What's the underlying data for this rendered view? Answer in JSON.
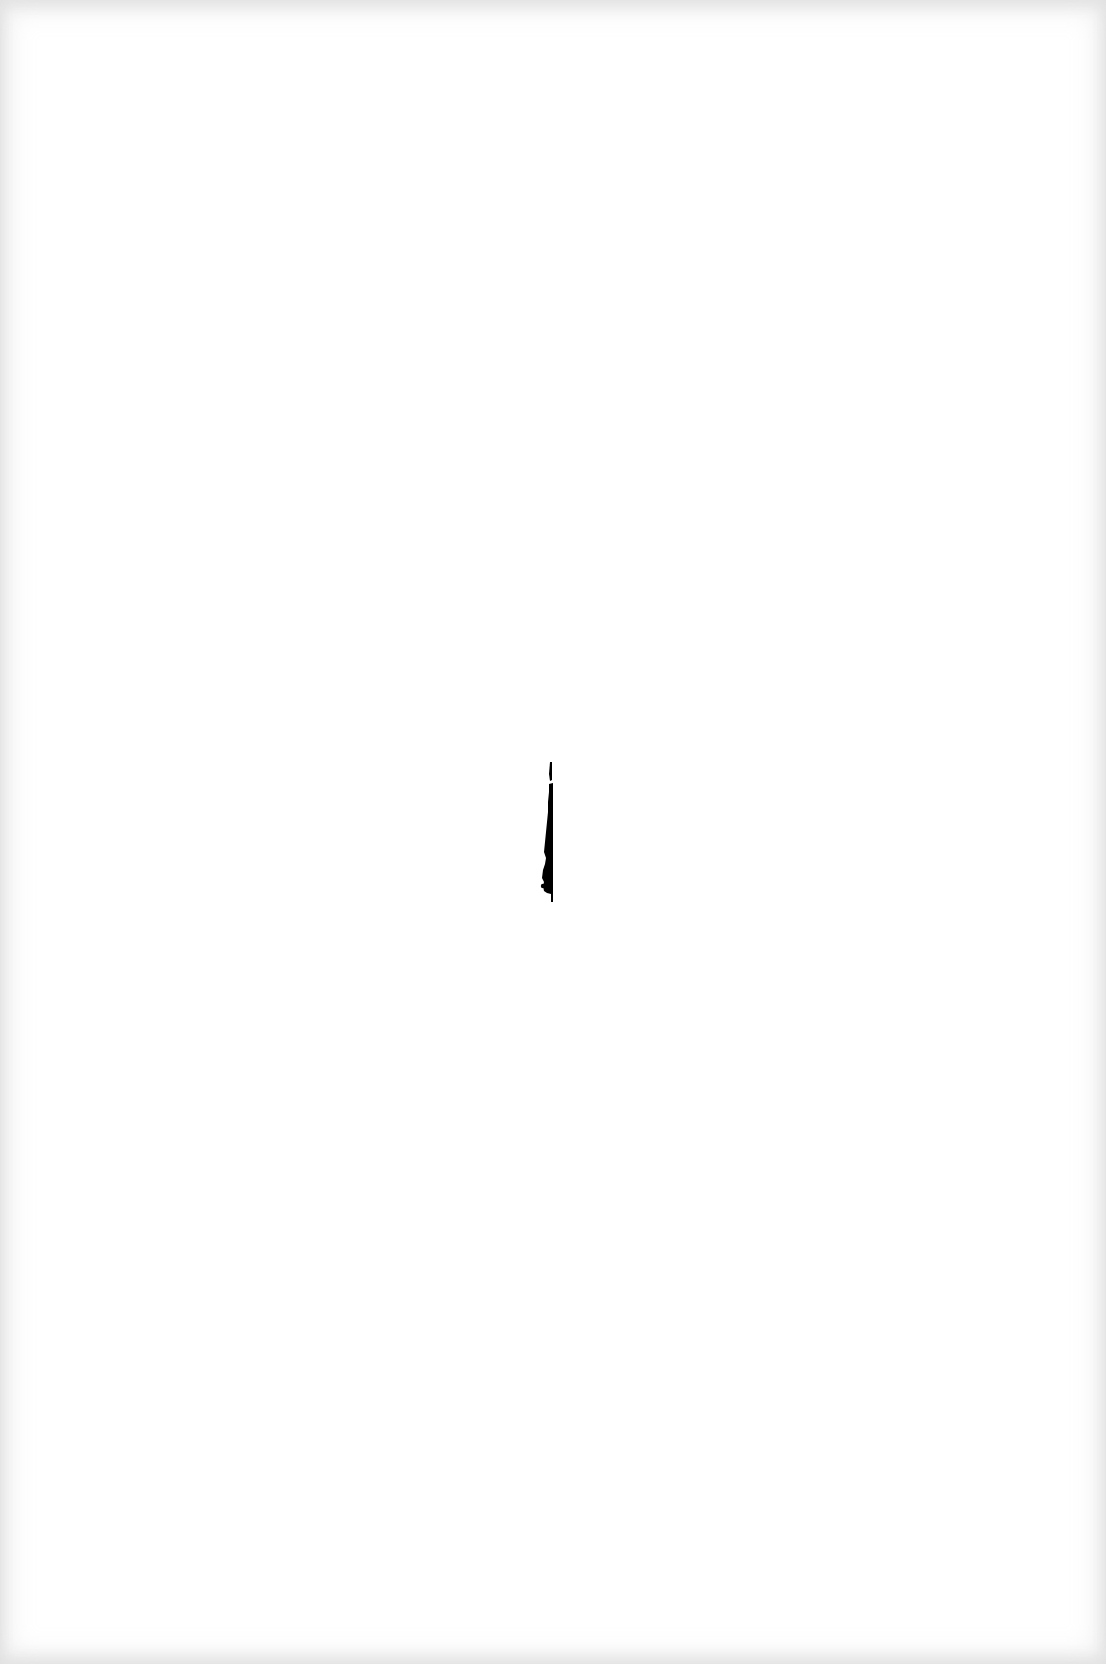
{
  "page": {
    "type": "blank scanned page",
    "background_color": "#ffffff",
    "edge_shade_color": "#e4e4e4",
    "text_content": ""
  },
  "artifact": {
    "kind": "vertical ink mark",
    "color": "#000000",
    "position": {
      "x": 538,
      "y": 762
    },
    "size": {
      "width": 16,
      "height": 140
    }
  }
}
